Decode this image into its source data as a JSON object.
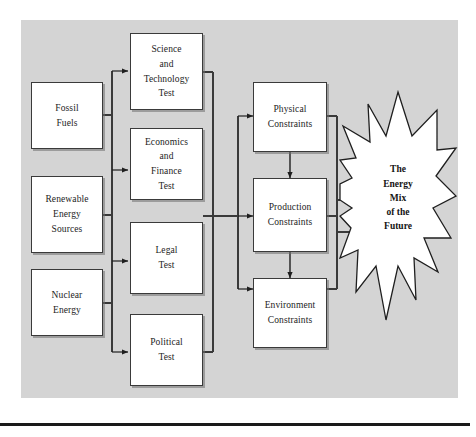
{
  "figure": {
    "panel_color": "#d4d4d4",
    "node_fill": "#ffffff",
    "line_color": "#3a3a3a",
    "text_color": "#1c1c1c"
  },
  "sources": {
    "group_label": "Energy sources",
    "items": [
      {
        "id": "fossil-fuels",
        "label": "Fossil\nFuels"
      },
      {
        "id": "renewable-energy-sources",
        "label": "Renewable\nEnergy\nSources"
      },
      {
        "id": "nuclear-energy",
        "label": "Nuclear\nEnergy"
      }
    ]
  },
  "tests": {
    "group_label": "Tests",
    "items": [
      {
        "id": "science-and-technology-test",
        "label": "Science\nand\nTechnology\nTest"
      },
      {
        "id": "economics-and-finance-test",
        "label": "Economics\nand\nFinance\nTest"
      },
      {
        "id": "legal-test",
        "label": "Legal\nTest"
      },
      {
        "id": "political-test",
        "label": "Political\nTest"
      }
    ]
  },
  "constraints": {
    "group_label": "Constraints",
    "items": [
      {
        "id": "physical-constraints",
        "label": "Physical\nConstraints"
      },
      {
        "id": "production-constraints",
        "label": "Production\nConstraints"
      },
      {
        "id": "environment-constraints",
        "label": "Environment\nConstraints"
      }
    ]
  },
  "outcome": {
    "id": "energy-mix-of-the-future",
    "label": "The\nEnergy\nMix\nof the\nFuture",
    "shape": "starburst"
  },
  "connections": [
    {
      "from": "sources-bus",
      "to": "science-and-technology-test",
      "type": "arrow"
    },
    {
      "from": "sources-bus",
      "to": "economics-and-finance-test",
      "type": "arrow"
    },
    {
      "from": "sources-bus",
      "to": "legal-test",
      "type": "arrow"
    },
    {
      "from": "sources-bus",
      "to": "political-test",
      "type": "arrow"
    },
    {
      "from": "tests-bus",
      "to": "physical-constraints",
      "type": "arrow"
    },
    {
      "from": "tests-bus",
      "to": "production-constraints",
      "type": "arrow"
    },
    {
      "from": "tests-bus",
      "to": "environment-constraints",
      "type": "arrow"
    },
    {
      "from": "physical-constraints",
      "to": "production-constraints",
      "type": "double-arrow"
    },
    {
      "from": "production-constraints",
      "to": "environment-constraints",
      "type": "double-arrow"
    },
    {
      "from": "constraints-bus",
      "to": "energy-mix-of-the-future",
      "type": "arrow"
    }
  ]
}
